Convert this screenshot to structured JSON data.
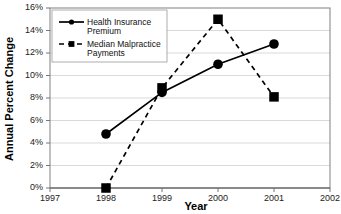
{
  "chart_data": {
    "type": "line",
    "title": "",
    "xlabel": "Year",
    "ylabel": "Annual Percent Change",
    "x": [
      1998,
      1999,
      2000,
      2001
    ],
    "xtick_labels": [
      "1997",
      "1998",
      "1999",
      "2000",
      "2001",
      "2002"
    ],
    "xlim": [
      1997,
      2002
    ],
    "ytick_labels": [
      "0%",
      "2%",
      "4%",
      "6%",
      "8%",
      "10%",
      "12%",
      "14%",
      "16%"
    ],
    "ytick_values": [
      0,
      2,
      4,
      6,
      8,
      10,
      12,
      14,
      16
    ],
    "ylim": [
      0,
      16
    ],
    "grid": true,
    "legend_position": "top-left",
    "series": [
      {
        "name": "Health Insurance Premium",
        "marker": "circle",
        "line_style": "solid",
        "color": "#000000",
        "values": [
          4.8,
          8.5,
          11.0,
          12.8
        ]
      },
      {
        "name": "Median Malpractice Payments",
        "marker": "square",
        "line_style": "dashed",
        "color": "#000000",
        "values": [
          0.0,
          8.9,
          15.0,
          8.1
        ]
      }
    ]
  },
  "legend": {
    "entries": [
      {
        "label_line1": "Health Insurance",
        "label_line2": "Premium"
      },
      {
        "label_line1": "Median Malpractice",
        "label_line2": "Payments"
      }
    ]
  }
}
